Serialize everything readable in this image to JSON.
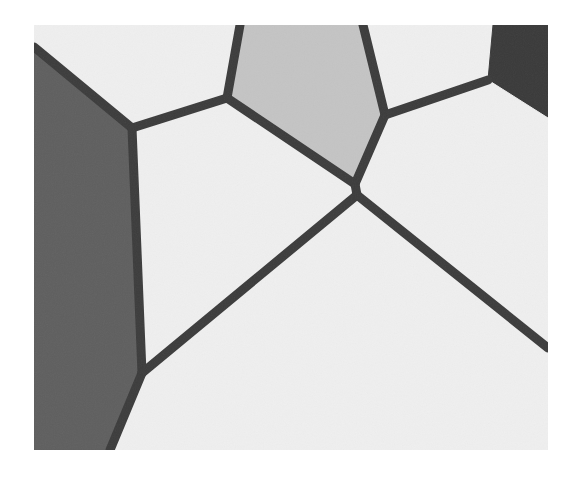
{
  "figure": {
    "type": "voronoi-tessellation",
    "frame": {
      "x": 34,
      "y": 25,
      "width": 514,
      "height": 425
    },
    "colors": {
      "page_background": "#ffffff",
      "light_cell": "#efefef",
      "mid_gray_cell": "#c4c4c4",
      "dark_gray_cell": "#5f5f5f",
      "darkest_cell": "#3a3a3a",
      "edge": "#3c3c3c"
    },
    "edge_width": 9,
    "vertices": {
      "G": [
        132,
        128
      ],
      "A": [
        227,
        98
      ],
      "B": [
        385,
        115
      ],
      "C": [
        355,
        184
      ],
      "D": [
        357,
        195
      ],
      "E": [
        488,
        80
      ],
      "F": [
        142,
        373
      ]
    },
    "cells": [
      {
        "name": "left-dark-cell",
        "shade": "dark_gray_cell",
        "points": [
          [
            34,
            25
          ],
          [
            34,
            47
          ],
          [
            132,
            128
          ],
          [
            142,
            373
          ],
          [
            110,
            450
          ],
          [
            34,
            450
          ]
        ]
      },
      {
        "name": "top-left-light-cell",
        "shade": "light_cell",
        "points": [
          [
            34,
            25
          ],
          [
            240,
            25
          ],
          [
            227,
            98
          ],
          [
            132,
            128
          ],
          [
            34,
            47
          ]
        ]
      },
      {
        "name": "top-center-gray-cell",
        "shade": "mid_gray_cell",
        "points": [
          [
            240,
            25
          ],
          [
            363,
            25
          ],
          [
            385,
            115
          ],
          [
            355,
            184
          ],
          [
            227,
            98
          ]
        ]
      },
      {
        "name": "top-right-light-cell",
        "shade": "light_cell",
        "points": [
          [
            363,
            25
          ],
          [
            493,
            25
          ],
          [
            488,
            80
          ],
          [
            385,
            115
          ]
        ]
      },
      {
        "name": "top-right-dark-cell",
        "shade": "darkest_cell",
        "points": [
          [
            493,
            25
          ],
          [
            548,
            25
          ],
          [
            548,
            118
          ],
          [
            488,
            80
          ]
        ]
      },
      {
        "name": "center-left-light-cell",
        "shade": "light_cell",
        "points": [
          [
            132,
            128
          ],
          [
            227,
            98
          ],
          [
            355,
            184
          ],
          [
            357,
            195
          ],
          [
            142,
            373
          ]
        ]
      },
      {
        "name": "right-light-cell",
        "shade": "light_cell",
        "points": [
          [
            385,
            115
          ],
          [
            488,
            80
          ],
          [
            548,
            118
          ],
          [
            548,
            348
          ],
          [
            357,
            195
          ],
          [
            355,
            184
          ]
        ]
      },
      {
        "name": "bottom-light-cell",
        "shade": "light_cell",
        "points": [
          [
            142,
            373
          ],
          [
            357,
            195
          ],
          [
            548,
            348
          ],
          [
            548,
            450
          ],
          [
            110,
            450
          ]
        ]
      }
    ],
    "edges": [
      {
        "name": "edge-left-top",
        "from": [
          34,
          47
        ],
        "to": [
          132,
          128
        ]
      },
      {
        "name": "edge-left-vertical",
        "from": [
          132,
          128
        ],
        "to": [
          142,
          373
        ]
      },
      {
        "name": "edge-left-bottom",
        "from": [
          142,
          373
        ],
        "to": [
          110,
          450
        ]
      },
      {
        "name": "edge-g-a",
        "from": [
          132,
          128
        ],
        "to": [
          227,
          98
        ]
      },
      {
        "name": "edge-a-top",
        "from": [
          227,
          98
        ],
        "to": [
          240,
          25
        ]
      },
      {
        "name": "edge-a-c",
        "from": [
          227,
          98
        ],
        "to": [
          355,
          184
        ]
      },
      {
        "name": "edge-b-top",
        "from": [
          385,
          115
        ],
        "to": [
          363,
          25
        ]
      },
      {
        "name": "edge-b-c",
        "from": [
          385,
          115
        ],
        "to": [
          355,
          184
        ]
      },
      {
        "name": "edge-c-d",
        "from": [
          355,
          184
        ],
        "to": [
          357,
          195
        ]
      },
      {
        "name": "edge-b-e",
        "from": [
          385,
          115
        ],
        "to": [
          488,
          80
        ]
      },
      {
        "name": "edge-d-f",
        "from": [
          357,
          195
        ],
        "to": [
          142,
          373
        ]
      },
      {
        "name": "edge-d-right",
        "from": [
          357,
          195
        ],
        "to": [
          548,
          348
        ]
      }
    ]
  }
}
